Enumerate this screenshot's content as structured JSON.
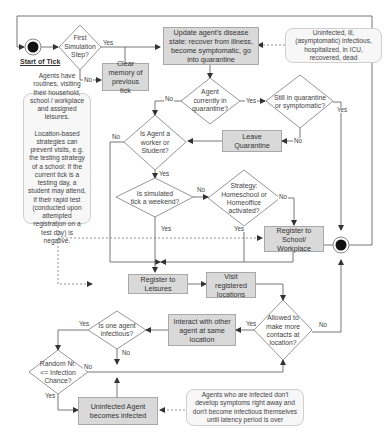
{
  "terminals": {
    "start": "Start of Tick",
    "end": "End of Tick"
  },
  "decisions": {
    "first_step": "First\nSimulation\nStep?",
    "in_quarantine": "Agent\ncurrently in\nquarantine?",
    "still_quarantine": "Still in quarantine\nor symptomatic?",
    "worker_student": "Is Agent a\nworker or\nStudent?",
    "weekend": "Is simulated\ntick a weekend?",
    "strategy": "Strategy:\nHomeschool or\nHomeoffice\nactivated?",
    "allowed_contacts": "Allowed to\nmake more\ncontacts at\nlocation?",
    "one_infectious": "Is one agent\ninfectious?",
    "random_chance": "Random Nr.\n<= Infection\nChance?"
  },
  "processes": {
    "update_state": "Update agent's disease state: recover from illness, become symptomatic, go into quarantine",
    "clear_memory": "Clear memory of previous tick",
    "leave_quarantine": "Leave Quarantine",
    "register_school": "Register to School/ Workplace",
    "register_leisures": "Register to Leisures",
    "visit_locations": "Visit registered locations",
    "interact": "Interact with other agent at same location",
    "becomes_infected": "Uninfected Agent becomes infected"
  },
  "notes": {
    "disease_states": "Uninfected, ill,\n(asymptomatic) infectious,\nhospitalized, in ICU,\nrecovered, dead",
    "routines": "Agents have routines, visiting their household, school / workplace and assigned leisures.\n\nLocation-based strategies can prevent visits, e.g. the testing strategy of a school: If the current tick is a testing day, a student may attend, if their rapid test (conducted upon attempted registration on a test day) is negative.",
    "latency": "Agents who are infected don't develop symptoms right away and don't  become infectious themselves until latency period is over"
  },
  "edge_labels": {
    "yes": "Yes",
    "no": "No"
  },
  "colors": {
    "process_fill": "#d9d9d9",
    "note_fill": "#f7f7f7",
    "line": "#555555",
    "terminal": "#111111"
  }
}
